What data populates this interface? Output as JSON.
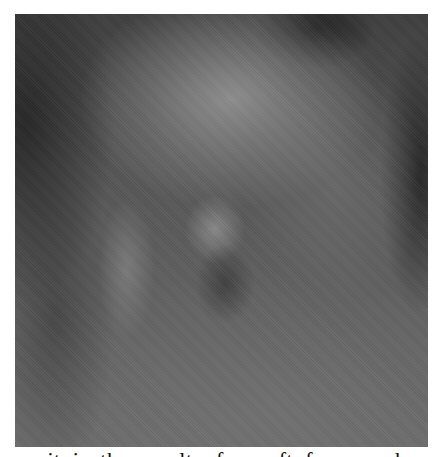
{
  "figure": {
    "tone": "grayscale",
    "colors": {
      "dark": "#2a2a2a",
      "mid": "#5c5c5c",
      "light": "#919191",
      "page_background": "#ffffff",
      "text": "#111111"
    }
  },
  "caption": {
    "text": "it is the result of a soft focus and",
    "clipped": true
  }
}
